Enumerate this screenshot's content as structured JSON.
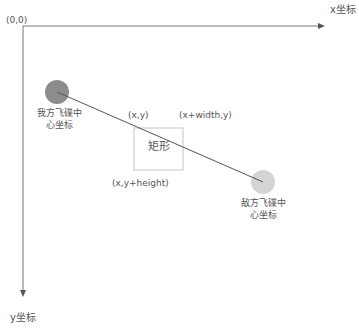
{
  "diagram": {
    "origin_label": "(0,0)",
    "x_axis_label": "x坐标",
    "y_axis_label": "y坐标",
    "rect": {
      "label": "矩形",
      "top_left_label": "(x,y)",
      "top_right_label": "(x+width,y)",
      "bottom_left_label": "(x,y+height)"
    },
    "our_ship": {
      "label_line1": "我方飞碟中",
      "label_line2": "心坐标",
      "color": "#8c8c8c"
    },
    "enemy_ship": {
      "label_line1": "敌方飞碟中",
      "label_line2": "心坐标",
      "color": "#d3d3d3"
    },
    "axis_color": "#666666",
    "rect_border_color": "#c0c0c0",
    "line_color": "#555555"
  }
}
